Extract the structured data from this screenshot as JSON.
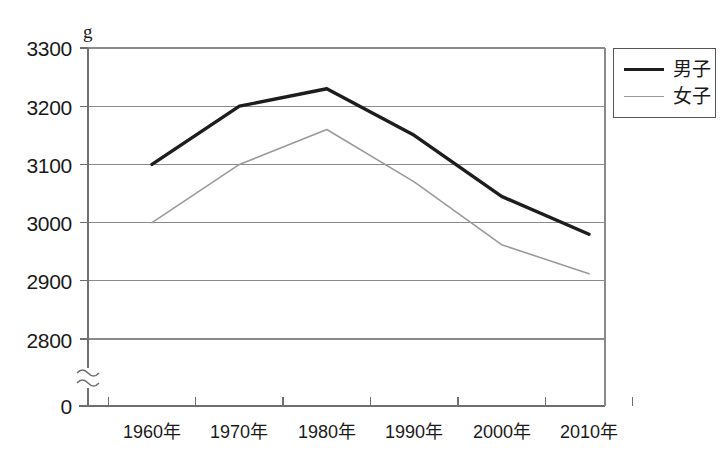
{
  "chart_data": {
    "type": "line",
    "title": "",
    "subtitle": "",
    "xlabel": "",
    "ylabel": "",
    "unit_label": "g",
    "categories": [
      "1960年",
      "1970年",
      "1980年",
      "1990年",
      "2000年",
      "2010年"
    ],
    "x_values": [
      1960,
      1970,
      1980,
      1990,
      2000,
      2010
    ],
    "y_ticks": [
      "3300",
      "3200",
      "3100",
      "3000",
      "2900",
      "2800",
      "0"
    ],
    "y_tick_values": [
      3300,
      3200,
      3100,
      3000,
      2900,
      2800,
      0
    ],
    "ylim": [
      2750,
      3300
    ],
    "axis_break": true,
    "axis_break_symbol": "≈",
    "grid": true,
    "legend_position": "top-right-outside",
    "series": [
      {
        "name": "男子",
        "color": "#1d1d1d",
        "line_width": 3.4,
        "values": [
          3100,
          3200,
          3230,
          3150,
          3045,
          2980
        ]
      },
      {
        "name": "女子",
        "color": "#9a9a9a",
        "line_width": 1.6,
        "values": [
          3000,
          3100,
          3160,
          3070,
          2962,
          2912
        ]
      }
    ]
  },
  "legend": {
    "items": [
      {
        "label": "男子"
      },
      {
        "label": "女子"
      }
    ]
  },
  "colors": {
    "boys_line": "#1d1d1d",
    "girls_line": "#9a9a9a",
    "grid": "#8a8a8a",
    "axis": "#6f6f6f",
    "text": "#1a1a1a",
    "background": "#ffffff"
  }
}
